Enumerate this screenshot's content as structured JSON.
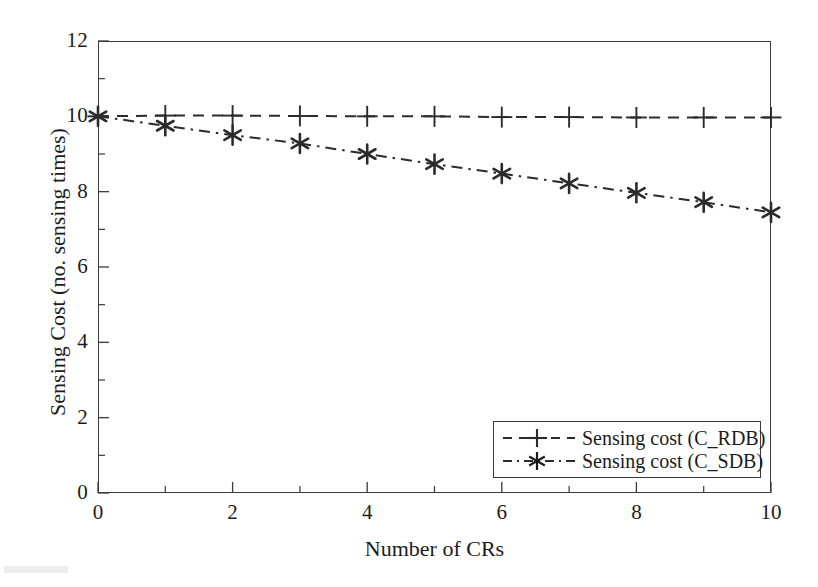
{
  "chart_data": {
    "type": "line",
    "title": "",
    "xlabel": "Number of CRs",
    "ylabel": "Sensing Cost (no. sensing times)",
    "xlim": [
      0,
      10
    ],
    "ylim": [
      0,
      12
    ],
    "x": [
      0,
      1,
      2,
      3,
      4,
      5,
      6,
      7,
      8,
      9,
      10
    ],
    "xticks": [
      0,
      2,
      4,
      6,
      8,
      10
    ],
    "xtick_labels": [
      "0",
      "2",
      "4",
      "6",
      "8",
      "10"
    ],
    "xminor_ticks": [
      1,
      3,
      5,
      7,
      9
    ],
    "yticks": [
      0,
      2,
      4,
      6,
      8,
      10,
      12
    ],
    "ytick_labels": [
      "0",
      "2",
      "4",
      "6",
      "8",
      "10",
      "12"
    ],
    "yminor_ticks": [
      1,
      3,
      5,
      7,
      9,
      11
    ],
    "grid": false,
    "legend_position": "lower right",
    "series": [
      {
        "name": "Sensing cost (C_RDB)",
        "marker": "plus",
        "linestyle": "dashed",
        "color": "#2b2b2b",
        "values": [
          10.0,
          10.02,
          10.02,
          10.01,
          10.0,
          10.0,
          9.98,
          9.98,
          9.97,
          9.97,
          9.97
        ]
      },
      {
        "name": "Sensing cost (C_SDB)",
        "marker": "asterisk",
        "linestyle": "dashdot",
        "color": "#2b2b2b",
        "values": [
          10.0,
          9.75,
          9.5,
          9.28,
          9.0,
          8.73,
          8.48,
          8.22,
          7.97,
          7.72,
          7.45
        ]
      }
    ]
  },
  "legend": {
    "items": [
      {
        "label": "Sensing cost (C_RDB)"
      },
      {
        "label": "Sensing cost (C_SDB)"
      }
    ]
  },
  "colors": {
    "axis": "#3b3b3b",
    "text": "#1c1c1c",
    "series": "#2b2b2b",
    "background": "#ffffff"
  }
}
